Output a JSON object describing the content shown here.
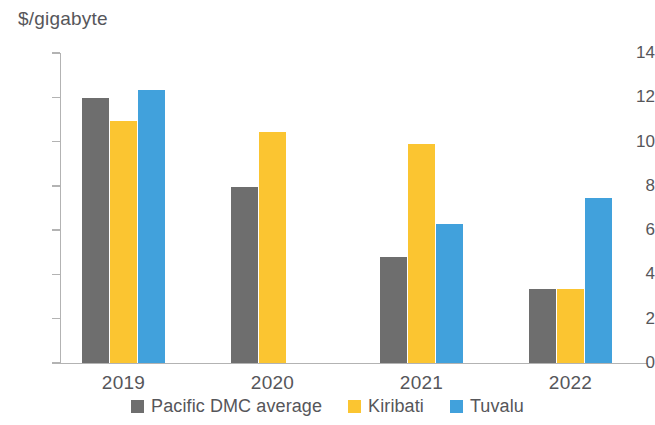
{
  "chart_data": {
    "type": "bar",
    "title": "",
    "subtitle": "",
    "xlabel": "",
    "ylabel": "$/gigabyte",
    "categories": [
      "2019",
      "2020",
      "2021",
      "2022"
    ],
    "ylim": [
      0,
      14
    ],
    "ytick_step": 2,
    "ytick_labels": [
      "14",
      "12",
      "10",
      "8",
      "6",
      "4",
      "2",
      "0"
    ],
    "ytick_values": [
      14,
      12,
      10,
      8,
      6,
      4,
      2,
      0
    ],
    "grid": false,
    "legend_position": "bottom",
    "series": [
      {
        "name": "Pacific DMC average",
        "color": "#6e6e6e",
        "values": [
          11.95,
          7.95,
          4.8,
          3.35
        ]
      },
      {
        "name": "Kiribati",
        "color": "#fbc531",
        "values": [
          10.95,
          10.45,
          9.9,
          3.35
        ]
      },
      {
        "name": "Tuvalu",
        "color": "#41a1dc",
        "values": [
          12.35,
          null,
          6.3,
          7.45
        ]
      }
    ],
    "annotations": []
  },
  "axis": {
    "unit_label": "$/gigabyte"
  },
  "legend": {
    "items": [
      {
        "label": "Pacific DMC average",
        "color": "#6e6e6e"
      },
      {
        "label": "Kiribati",
        "color": "#fbc531"
      },
      {
        "label": "Tuvalu",
        "color": "#41a1dc"
      }
    ]
  }
}
